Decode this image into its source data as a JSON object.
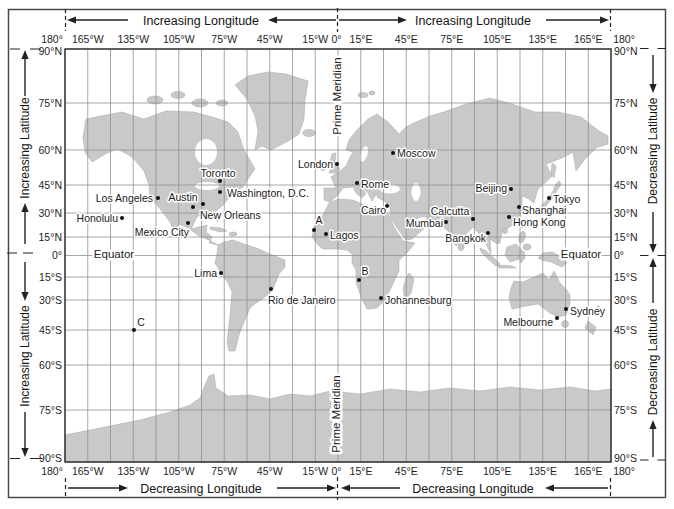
{
  "colors": {
    "land": "#c9c9c9",
    "ocean": "#ffffff",
    "grid": "#909090",
    "ink": "#1e1e1e"
  },
  "axes": {
    "top": {
      "left_label": "Increasing Longitude",
      "right_label": "Increasing Longitude"
    },
    "bottom": {
      "left_label": "Decreasing Longitude",
      "right_label": "Decreasing Longitude"
    },
    "left": {
      "top_label": "Increasing Latitude",
      "bottom_label": "Increasing Latitude"
    },
    "right": {
      "top_label": "Decreasing Latitude",
      "bottom_label": "Decreasing Latitude"
    }
  },
  "grid": {
    "lon_x": [
      65,
      87.75,
      110.5,
      133.25,
      156,
      178.75,
      201.5,
      224.25,
      247,
      269.75,
      292.5,
      315.25,
      338,
      360.75,
      383.5,
      406.25,
      429,
      451.75,
      474.5,
      497.25,
      520,
      542.75,
      565.5,
      588.25,
      611
    ]
  },
  "longitude_ticks": [
    {
      "label": "180°",
      "x": 52
    },
    {
      "label": "165°W",
      "x": 87.75
    },
    {
      "label": "135°W",
      "x": 133.25
    },
    {
      "label": "105°W",
      "x": 178.75
    },
    {
      "label": "75°W",
      "x": 224.25
    },
    {
      "label": "45°W",
      "x": 269.75
    },
    {
      "label": "15°W",
      "x": 315.25
    },
    {
      "label": "0°",
      "x": 336.5
    },
    {
      "label": "15°E",
      "x": 361
    },
    {
      "label": "45°E",
      "x": 406.25
    },
    {
      "label": "75°E",
      "x": 451.75
    },
    {
      "label": "105°E",
      "x": 497.25
    },
    {
      "label": "135°E",
      "x": 542.75
    },
    {
      "label": "165°E",
      "x": 588.25
    },
    {
      "label": "180°",
      "x": 624
    }
  ],
  "latitude_ticks": [
    {
      "label": "90°N",
      "y": 49,
      "ly": 51
    },
    {
      "label": "75°N",
      "y": 103
    },
    {
      "label": "60°N",
      "y": 150
    },
    {
      "label": "45°N",
      "y": 185
    },
    {
      "label": "30°N",
      "y": 213
    },
    {
      "label": "15°N",
      "y": 237
    },
    {
      "label": "0°",
      "y": 255.5
    },
    {
      "label": "15°S",
      "y": 277
    },
    {
      "label": "30°S",
      "y": 300
    },
    {
      "label": "45°S",
      "y": 330
    },
    {
      "label": "60°S",
      "y": 365
    },
    {
      "label": "75°S",
      "y": 410
    },
    {
      "label": "90°S",
      "y": 462,
      "ly": 458
    }
  ],
  "reference_lines": {
    "equator_label": "Equator",
    "prime_meridian_label": "Prime Meridian"
  },
  "equator_label_positions": [
    [
      114,
      258
    ],
    [
      581,
      258
    ]
  ],
  "prime_meridian_label_positions": [
    [
      341,
      96
    ],
    [
      340,
      414
    ]
  ],
  "cities": [
    {
      "name": "Toronto",
      "dot": [
        220,
        181
      ],
      "label": [
        218,
        177
      ],
      "anchor": "middle"
    },
    {
      "name": "Washington, D.C.",
      "dot": [
        220,
        192
      ],
      "label": [
        227,
        197
      ],
      "anchor": "start"
    },
    {
      "name": "Los Angeles",
      "dot": [
        158,
        198
      ],
      "label": [
        153,
        202
      ],
      "anchor": "end"
    },
    {
      "name": "Austin",
      "dot": [
        193,
        207
      ],
      "label": [
        183,
        201
      ],
      "anchor": "middle"
    },
    {
      "name": "New Orleans",
      "dot": [
        203,
        204
      ],
      "label": [
        200,
        219
      ],
      "anchor": "start"
    },
    {
      "name": "Honolulu",
      "dot": [
        122,
        218
      ],
      "label": [
        118,
        222
      ],
      "anchor": "end"
    },
    {
      "name": "Mexico City",
      "dot": [
        188,
        223
      ],
      "label": [
        189,
        236
      ],
      "anchor": "end"
    },
    {
      "name": "London",
      "dot": [
        337,
        164
      ],
      "label": [
        333,
        168
      ],
      "anchor": "end"
    },
    {
      "name": "Moscow",
      "dot": [
        393,
        153
      ],
      "label": [
        397,
        157
      ],
      "anchor": "start"
    },
    {
      "name": "Rome",
      "dot": [
        357,
        183
      ],
      "label": [
        361,
        188
      ],
      "anchor": "start"
    },
    {
      "name": "Cairo",
      "dot": [
        387,
        206
      ],
      "label": [
        386,
        214
      ],
      "anchor": "end"
    },
    {
      "name": "Lagos",
      "dot": [
        326,
        234
      ],
      "label": [
        330,
        239
      ],
      "anchor": "start"
    },
    {
      "name": "Calcutta",
      "dot": [
        473,
        219
      ],
      "label": [
        450,
        215
      ],
      "anchor": "middle"
    },
    {
      "name": "Mumbai",
      "dot": [
        446,
        222
      ],
      "label": [
        443,
        227
      ],
      "anchor": "end"
    },
    {
      "name": "Bangkok",
      "dot": [
        488,
        233
      ],
      "label": [
        486,
        242
      ],
      "anchor": "end"
    },
    {
      "name": "Beijing",
      "dot": [
        511,
        189
      ],
      "label": [
        507,
        192
      ],
      "anchor": "end"
    },
    {
      "name": "Tokyo",
      "dot": [
        549,
        198
      ],
      "label": [
        553,
        203
      ],
      "anchor": "start"
    },
    {
      "name": "Shanghai",
      "dot": [
        519,
        207
      ],
      "label": [
        522,
        214
      ],
      "anchor": "start"
    },
    {
      "name": "Hong Kong",
      "dot": [
        509,
        217
      ],
      "label": [
        513,
        226
      ],
      "anchor": "start"
    },
    {
      "name": "Lima",
      "dot": [
        221,
        273
      ],
      "label": [
        217,
        277
      ],
      "anchor": "end"
    },
    {
      "name": "Rio de Janeiro",
      "dot": [
        271,
        289
      ],
      "label": [
        268,
        304
      ],
      "anchor": "start"
    },
    {
      "name": "Johannesburg",
      "dot": [
        381,
        298
      ],
      "label": [
        385,
        304
      ],
      "anchor": "start"
    },
    {
      "name": "Melbourne",
      "dot": [
        557,
        318
      ],
      "label": [
        553,
        326
      ],
      "anchor": "end"
    },
    {
      "name": "Sydney",
      "dot": [
        566,
        309
      ],
      "label": [
        570,
        315
      ],
      "anchor": "start"
    }
  ],
  "lettered_points": [
    {
      "name": "A",
      "dot": [
        314,
        230
      ],
      "label": [
        319,
        224
      ],
      "anchor": "middle"
    },
    {
      "name": "B",
      "dot": [
        359,
        280
      ],
      "label": [
        365,
        275
      ],
      "anchor": "middle"
    },
    {
      "name": "C",
      "dot": [
        134,
        330
      ],
      "label": [
        141,
        326
      ],
      "anchor": "middle"
    }
  ]
}
